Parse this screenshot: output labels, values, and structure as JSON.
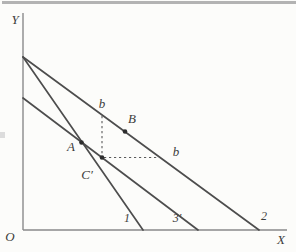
{
  "colors": {
    "background": "#fcfcfa",
    "top_band": "#b3b3b3",
    "axis": "#8a8a8a",
    "line": "#4d4d4d",
    "dash": "#5a5a5a",
    "point": "#2d2d2d",
    "text": "#3c3c3c",
    "artifact": "#dcdcdc"
  },
  "axes": {
    "y_label": "Y",
    "x_label": "X",
    "origin_label": "O"
  },
  "points": {
    "a_label": "A",
    "b_label": "B",
    "c_prime_label": "C′"
  },
  "markers": {
    "b_upper_label": "b",
    "b_lower_label": "b"
  },
  "lines": {
    "line1_label": "1",
    "line2_label": "2",
    "line3_label": "3′"
  }
}
